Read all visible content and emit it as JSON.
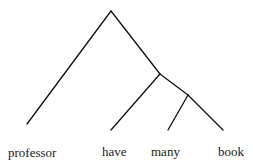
{
  "tree": {
    "stroke_color": "#111111",
    "leaves": [
      {
        "label": "professor"
      },
      {
        "label": "have"
      },
      {
        "label": "many"
      },
      {
        "label": "book"
      }
    ]
  }
}
